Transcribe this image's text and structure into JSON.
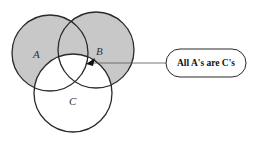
{
  "diagram": {
    "type": "venn",
    "circles": [
      {
        "id": "A",
        "label": "A",
        "cx": 50,
        "cy": 53,
        "r": 38,
        "shaded": true
      },
      {
        "id": "B",
        "label": "B",
        "cx": 96,
        "cy": 50,
        "r": 38,
        "shaded": true
      },
      {
        "id": "C",
        "label": "C",
        "cx": 73,
        "cy": 93,
        "r": 39,
        "shaded": false
      }
    ],
    "labels": {
      "a": "A",
      "b": "B",
      "c": "C"
    },
    "callout": {
      "text": "All A's are C's",
      "arrow_tip": [
        87,
        63
      ]
    },
    "colors": {
      "shade": "#c8c8c8",
      "stroke": "#2a2a2a",
      "background": "#ffffff"
    }
  }
}
